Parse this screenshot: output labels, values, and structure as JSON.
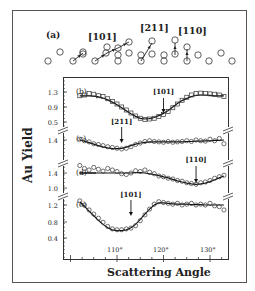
{
  "figure": {
    "panel_a": {
      "label": "(a)",
      "directions": [
        "[101]",
        "[211]",
        "[110]"
      ]
    },
    "y_axis_label": "Au Yield",
    "x_axis_label": "Scattering Angle",
    "x_ticks": [
      "110°",
      "120°",
      "130°"
    ]
  },
  "chart_data": [
    {
      "panel": "(b)",
      "type": "scatter",
      "marker": "square",
      "annotation": {
        "label": "[101]",
        "x": 120
      },
      "yticks": [
        "1.3",
        "0.9",
        "0.5"
      ],
      "x": [
        102,
        103,
        104,
        105,
        106,
        107,
        108,
        109,
        110,
        111,
        112,
        113,
        114,
        115,
        116,
        117,
        118,
        119,
        120,
        121,
        122,
        123,
        124,
        125,
        126,
        127,
        128,
        129,
        130,
        131,
        132,
        133
      ],
      "values": [
        1.2,
        1.22,
        1.26,
        1.24,
        1.2,
        1.18,
        1.12,
        1.05,
        0.98,
        0.9,
        0.82,
        0.74,
        0.66,
        0.6,
        0.57,
        0.58,
        0.6,
        0.65,
        0.7,
        0.78,
        0.88,
        0.98,
        1.08,
        1.16,
        1.22,
        1.26,
        1.27,
        1.26,
        1.25,
        1.24,
        1.22,
        1.18
      ],
      "fit": [
        1.2,
        1.2,
        1.2,
        1.19,
        1.17,
        1.14,
        1.09,
        1.03,
        0.96,
        0.88,
        0.8,
        0.72,
        0.65,
        0.6,
        0.58,
        0.59,
        0.62,
        0.67,
        0.73,
        0.81,
        0.9,
        0.99,
        1.07,
        1.13,
        1.18,
        1.21,
        1.22,
        1.22,
        1.21,
        1.2,
        1.2,
        1.2
      ]
    },
    {
      "panel": "(c)",
      "type": "scatter",
      "marker": "circle",
      "annotation": {
        "label": "[211]",
        "x": 111
      },
      "yticks": [
        "1.4"
      ],
      "x": [
        102,
        103,
        104,
        105,
        106,
        107,
        108,
        109,
        110,
        111,
        112,
        113,
        114,
        115,
        116,
        117,
        118,
        119,
        120,
        121,
        122,
        123,
        124,
        125,
        126,
        127,
        128,
        129,
        130,
        131,
        132,
        133
      ],
      "values": [
        1.42,
        1.38,
        1.35,
        1.3,
        1.28,
        1.25,
        1.22,
        1.2,
        1.18,
        1.16,
        1.18,
        1.22,
        1.28,
        1.32,
        1.36,
        1.38,
        1.36,
        1.35,
        1.34,
        1.36,
        1.34,
        1.35,
        1.36,
        1.38,
        1.36,
        1.4,
        1.38,
        1.37,
        1.42,
        1.38,
        1.44,
        1.3
      ],
      "fit": [
        1.4,
        1.37,
        1.33,
        1.29,
        1.25,
        1.22,
        1.19,
        1.17,
        1.17,
        1.18,
        1.21,
        1.25,
        1.29,
        1.32,
        1.34,
        1.35,
        1.35,
        1.35,
        1.35,
        1.35,
        1.35,
        1.35,
        1.35,
        1.36,
        1.36,
        1.37,
        1.37,
        1.38,
        1.38,
        1.39,
        1.39,
        1.4
      ]
    },
    {
      "panel": "(d)",
      "type": "scatter",
      "marker": "circle",
      "annotation": {
        "label": "[110]",
        "x": 127
      },
      "yticks": [
        "1.4",
        "1.0"
      ],
      "x": [
        102,
        103,
        104,
        105,
        106,
        107,
        108,
        109,
        110,
        111,
        112,
        113,
        114,
        115,
        116,
        117,
        118,
        119,
        120,
        121,
        122,
        123,
        124,
        125,
        126,
        127,
        128,
        129,
        130,
        131,
        132,
        133
      ],
      "values": [
        1.6,
        1.52,
        1.48,
        1.55,
        1.5,
        1.45,
        1.52,
        1.48,
        1.44,
        1.38,
        1.36,
        1.4,
        1.46,
        1.44,
        1.48,
        1.42,
        1.38,
        1.32,
        1.3,
        1.26,
        1.24,
        1.2,
        1.18,
        1.14,
        1.12,
        1.1,
        1.14,
        1.16,
        1.2,
        1.26,
        1.3,
        1.34
      ],
      "fit": [
        1.4,
        1.4,
        1.4,
        1.4,
        1.4,
        1.4,
        1.4,
        1.4,
        1.4,
        1.4,
        1.4,
        1.4,
        1.41,
        1.41,
        1.4,
        1.38,
        1.36,
        1.33,
        1.3,
        1.27,
        1.23,
        1.19,
        1.16,
        1.13,
        1.11,
        1.1,
        1.11,
        1.13,
        1.17,
        1.22,
        1.27,
        1.32
      ]
    },
    {
      "panel": "(e)",
      "type": "scatter",
      "marker": "circle",
      "annotation": {
        "label": "[101]",
        "x": 113
      },
      "yticks": [
        "1.2",
        "0.8",
        "0.4"
      ],
      "x": [
        102,
        103,
        104,
        105,
        106,
        107,
        108,
        109,
        110,
        111,
        112,
        113,
        114,
        115,
        116,
        117,
        118,
        119,
        120,
        121,
        122,
        123,
        124,
        125,
        126,
        127,
        128,
        129,
        130,
        131,
        132,
        133
      ],
      "values": [
        1.3,
        1.2,
        1.08,
        0.98,
        0.88,
        0.78,
        0.68,
        0.62,
        0.6,
        0.6,
        0.62,
        0.64,
        0.7,
        0.82,
        0.96,
        1.1,
        1.22,
        1.28,
        1.26,
        1.24,
        1.22,
        1.24,
        1.2,
        1.22,
        1.24,
        1.2,
        1.22,
        1.2,
        1.24,
        1.18,
        1.16,
        1.08
      ],
      "fit": [
        1.28,
        1.17,
        1.05,
        0.94,
        0.83,
        0.73,
        0.65,
        0.6,
        0.58,
        0.58,
        0.6,
        0.65,
        0.73,
        0.85,
        0.98,
        1.1,
        1.2,
        1.25,
        1.25,
        1.24,
        1.23,
        1.22,
        1.22,
        1.22,
        1.21,
        1.21,
        1.21,
        1.2,
        1.2,
        1.2,
        1.2,
        1.2
      ]
    }
  ]
}
